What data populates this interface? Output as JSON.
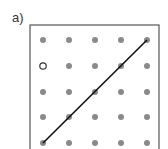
{
  "figure": {
    "label": "a)",
    "box": {
      "x": 30,
      "y": 25,
      "width": 129,
      "height": 130,
      "stroke": "#555555"
    },
    "grid": {
      "columns": [
        43,
        69,
        95,
        121,
        147
      ],
      "rows": [
        40,
        66,
        92,
        117,
        143
      ],
      "dot_color": "#8a8a8a",
      "dot_radius": 3
    },
    "open_point": {
      "col": 0,
      "row": 1,
      "color": "#333333"
    },
    "line": {
      "from": {
        "col": 0,
        "row": 4
      },
      "to": {
        "col": 4,
        "row": 0
      },
      "color": "#111111"
    }
  }
}
